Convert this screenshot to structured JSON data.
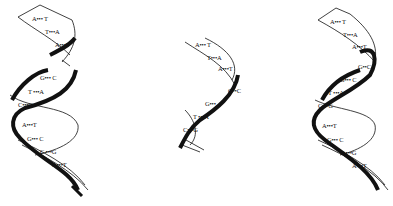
{
  "diagram": {
    "colors": {
      "strand": "#111111",
      "background": "#ffffff"
    },
    "helices": [
      {
        "id": "left",
        "name": "partially unwound original helix",
        "pairs": [
          {
            "label": "A••• T",
            "x": 32,
            "y": 19
          },
          {
            "label": "T•••A",
            "x": 45,
            "y": 32
          },
          {
            "label": "A•••T",
            "x": 55,
            "y": 45
          },
          {
            "label": "G••• C",
            "x": 40,
            "y": 78
          },
          {
            "label": "T •••A",
            "x": 28,
            "y": 92
          },
          {
            "label": "C•••G",
            "x": 18,
            "y": 105
          },
          {
            "label": "A•••T",
            "x": 22,
            "y": 125
          },
          {
            "label": "G••• C",
            "x": 27,
            "y": 139
          },
          {
            "label": "C •••G",
            "x": 40,
            "y": 152
          },
          {
            "label": "A•••T",
            "x": 52,
            "y": 165
          }
        ]
      },
      {
        "id": "middle",
        "name": "daughter helix (partial)",
        "pairs": [
          {
            "label": "A••• T",
            "x": 195,
            "y": 45
          },
          {
            "label": "T•••A",
            "x": 207,
            "y": 58
          },
          {
            "label": "A•••T",
            "x": 218,
            "y": 69
          },
          {
            "label": "G••C",
            "x": 228,
            "y": 91
          },
          {
            "label": "G•••",
            "x": 205,
            "y": 104
          },
          {
            "label": "T •••A",
            "x": 193,
            "y": 117
          },
          {
            "label": "C•••G",
            "x": 183,
            "y": 130
          }
        ]
      },
      {
        "id": "right",
        "name": "complete daughter helix",
        "pairs": [
          {
            "label": "A••• T",
            "x": 330,
            "y": 22
          },
          {
            "label": "T•••A",
            "x": 343,
            "y": 35
          },
          {
            "label": "A•••T",
            "x": 352,
            "y": 47
          },
          {
            "label": "G••C",
            "x": 358,
            "y": 67
          },
          {
            "label": "G••• C",
            "x": 340,
            "y": 80
          },
          {
            "label": "T •••A",
            "x": 328,
            "y": 93
          },
          {
            "label": "C•••G",
            "x": 318,
            "y": 106
          },
          {
            "label": "A•••T",
            "x": 322,
            "y": 126
          },
          {
            "label": "G••• C",
            "x": 327,
            "y": 140
          },
          {
            "label": "C •••G",
            "x": 340,
            "y": 153
          },
          {
            "label": "A•••T",
            "x": 352,
            "y": 166
          }
        ]
      }
    ]
  }
}
